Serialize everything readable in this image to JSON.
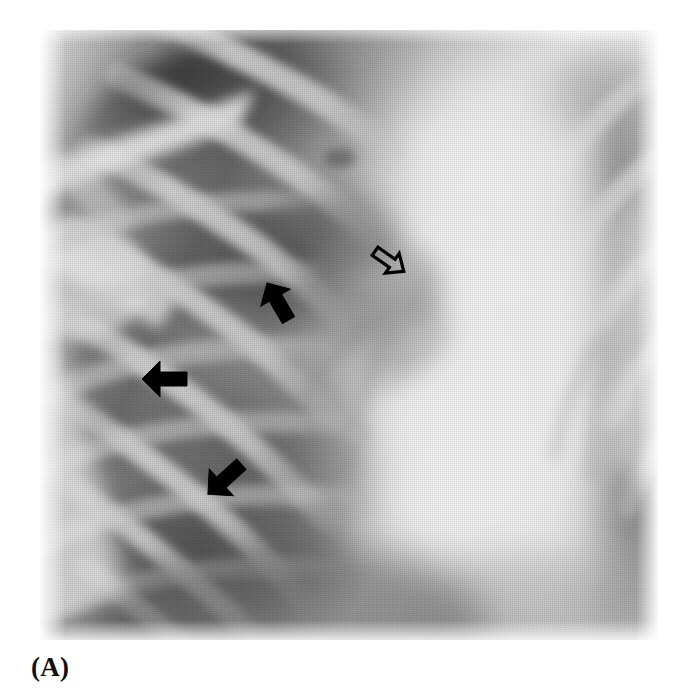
{
  "figure": {
    "caption": "(A)",
    "modality": "chest-radiograph",
    "view": "frontal-pa",
    "plate": {
      "x": 40,
      "y": 30,
      "width": 618,
      "height": 610,
      "background_color": "#f2f2f2",
      "border_color": "#ffffff"
    }
  },
  "page": {
    "width": 691,
    "height": 698,
    "background_color": "#ffffff"
  },
  "palette": {
    "arrow_solid": "#000000",
    "arrow_open_stroke": "#000000",
    "arrow_open_fill": "none",
    "lung_dark": "#3a3a3a",
    "lung_mid": "#6e6e6e",
    "bone_light": "#d9d9d9",
    "mediastinum_bright": "#f4f4f4",
    "soft_tissue": "#b4b4b4",
    "caption_color": "#101010"
  },
  "annotations": [
    {
      "id": "arrow-open-hilar",
      "style": "open",
      "label": "open-arrow",
      "direction": "down-left",
      "rotation_deg": 215,
      "x": 366,
      "y": 238,
      "size": 40,
      "points_at": "right-hilum"
    },
    {
      "id": "arrow-solid-upper",
      "style": "solid",
      "label": "solid-arrow",
      "direction": "down-right",
      "rotation_deg": 60,
      "x": 252,
      "y": 276,
      "size": 44,
      "points_at": "upper-lesion-margin"
    },
    {
      "id": "arrow-solid-middle",
      "style": "solid",
      "label": "solid-arrow",
      "direction": "right",
      "rotation_deg": 0,
      "x": 138,
      "y": 352,
      "size": 46,
      "points_at": "lateral-lesion-margin"
    },
    {
      "id": "arrow-solid-lower",
      "style": "solid",
      "label": "solid-arrow",
      "direction": "up-right",
      "rotation_deg": -42,
      "x": 198,
      "y": 452,
      "size": 46,
      "points_at": "inferior-lesion-margin"
    }
  ],
  "anatomy_regions": [
    {
      "id": "right-lung-field",
      "label": "right lung field",
      "tone": "dark"
    },
    {
      "id": "left-lung-field",
      "label": "left lung field",
      "tone": "mid"
    },
    {
      "id": "mediastinum",
      "label": "mediastinum / heart border",
      "tone": "bright"
    },
    {
      "id": "clavicle-scapula",
      "label": "clavicle and scapula",
      "tone": "bright"
    },
    {
      "id": "rib-cage-posterior",
      "label": "posterior ribs",
      "tone": "light"
    },
    {
      "id": "rib-cage-anterior",
      "label": "anterior ribs",
      "tone": "light"
    },
    {
      "id": "hilar-mass",
      "label": "perihilar opacity",
      "tone": "mid"
    }
  ]
}
